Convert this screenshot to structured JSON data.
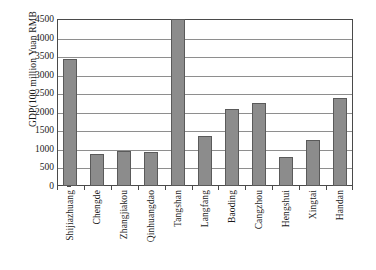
{
  "chart_data": {
    "type": "bar",
    "title": "",
    "xlabel": "",
    "ylabel": "GDP(100 million Yuan  RMB",
    "ylim": [
      0,
      4500
    ],
    "ytick_step": 500,
    "yticks": [
      "4500",
      "4000",
      "3500",
      "3000",
      "2500",
      "2000",
      "1500",
      "1000",
      "500",
      "0"
    ],
    "ytick_values": [
      4500,
      4000,
      3500,
      3000,
      2500,
      2000,
      1500,
      1000,
      500,
      0
    ],
    "grid": true,
    "legend": "none",
    "categories": [
      "Shijiazhuang",
      "Chengde",
      "Zhangjiakou",
      "Qinhuangdao",
      "Tangshan",
      "Langfang",
      "Baoding",
      "Cangzhou",
      "Hengshui",
      "Xingtai",
      "Handan"
    ],
    "values": [
      3420,
      860,
      950,
      920,
      4500,
      1350,
      2070,
      2230,
      780,
      1240,
      2380
    ],
    "bar_color": "#8c8c8c",
    "bar_border_color": "#5a5a5a",
    "axis_color": "#4a4a4a",
    "grid_color": "#8e8e8e",
    "background": "#ffffff"
  }
}
